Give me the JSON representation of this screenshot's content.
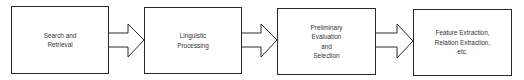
{
  "diagram": {
    "type": "flowchart",
    "direction": "left-to-right",
    "stages": [
      {
        "id": "search",
        "lines": [
          "Search and",
          "Retrieval"
        ]
      },
      {
        "id": "linguistic",
        "lines": [
          "Linguistic",
          "Processing"
        ]
      },
      {
        "id": "preliminary",
        "lines": [
          "Preliminary",
          "Evaluation",
          "and",
          "Selection"
        ]
      },
      {
        "id": "feature",
        "lines": [
          "Feature Extraction,",
          "Relation Extraction,",
          "etc."
        ]
      }
    ],
    "connections": [
      {
        "from": "search",
        "to": "linguistic",
        "style": "block-arrow"
      },
      {
        "from": "linguistic",
        "to": "preliminary",
        "style": "block-arrow"
      },
      {
        "from": "preliminary",
        "to": "feature",
        "style": "block-arrow"
      }
    ],
    "colors": {
      "stroke": "#2a2a2a",
      "text": "#333333",
      "background": "#ffffff"
    }
  }
}
